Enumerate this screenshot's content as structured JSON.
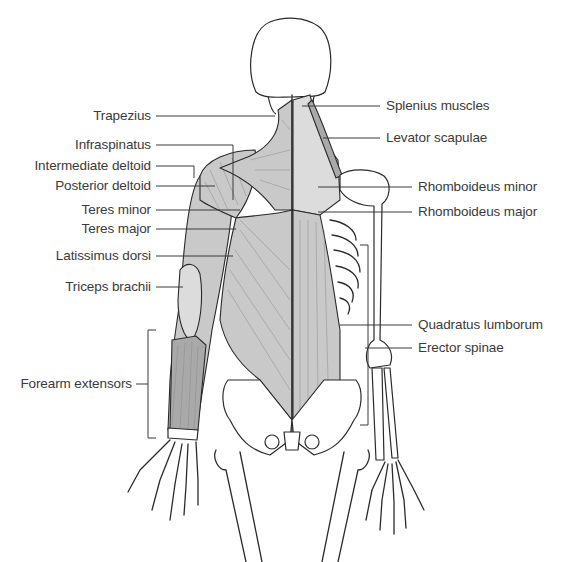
{
  "figure": {
    "labels_left": [
      {
        "id": "trapezius",
        "text": "Trapezius"
      },
      {
        "id": "infraspinatus",
        "text": "Infraspinatus"
      },
      {
        "id": "intermediate-deltoid",
        "text": "Intermediate deltoid"
      },
      {
        "id": "posterior-deltoid",
        "text": "Posterior deltoid"
      },
      {
        "id": "teres-minor",
        "text": "Teres minor"
      },
      {
        "id": "teres-major",
        "text": "Teres major"
      },
      {
        "id": "latissimus-dorsi",
        "text": "Latissimus dorsi"
      },
      {
        "id": "triceps-brachii",
        "text": "Triceps brachii"
      },
      {
        "id": "forearm-extensors",
        "text": "Forearm extensors"
      }
    ],
    "labels_right": [
      {
        "id": "splenius-muscles",
        "text": "Splenius muscles"
      },
      {
        "id": "levator-scapulae",
        "text": "Levator scapulae"
      },
      {
        "id": "rhomboideus-minor",
        "text": "Rhomboideus minor"
      },
      {
        "id": "rhomboideus-major",
        "text": "Rhomboideus major"
      },
      {
        "id": "quadratus-lumborum",
        "text": "Quadratus lumborum"
      },
      {
        "id": "erector-spinae",
        "text": "Erector spinae"
      }
    ]
  }
}
